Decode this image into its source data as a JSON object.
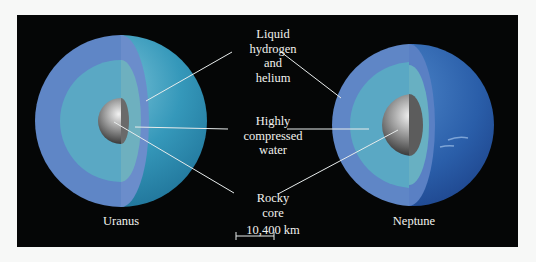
{
  "diagram": {
    "planets": [
      {
        "name": "Uranus",
        "cx": 121,
        "cy": 121,
        "r": 86,
        "surface_color": "#2f8fb0"
      },
      {
        "name": "Neptune",
        "cx": 413,
        "cy": 125,
        "r": 81,
        "surface_color": "#2a5fa8"
      }
    ],
    "layers": [
      {
        "id": "outer",
        "lines": [
          "Liquid",
          "hydrogen",
          "and",
          "helium"
        ],
        "color": "#5f86c6"
      },
      {
        "id": "mantle",
        "lines": [
          "Highly",
          "compressed",
          "water"
        ],
        "color": "#5aa8c4"
      },
      {
        "id": "core",
        "lines": [
          "Rocky",
          "core"
        ],
        "color": "#8a8a8a"
      }
    ],
    "scale_bar": {
      "label": "10,400 km"
    },
    "colors": {
      "background": "#050606",
      "page": "#f7f8f7",
      "text": "#f2f2ee",
      "leader": "#e8ecec"
    }
  }
}
